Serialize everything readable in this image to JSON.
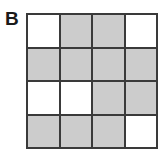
{
  "panel": {
    "label": "B"
  },
  "colors": {
    "filled": "#cccccc",
    "empty": "#ffffff",
    "grid_line": "#3a3a3a",
    "background": "#ffffff",
    "label_color": "#1a1a1a"
  },
  "grid": {
    "rows": 4,
    "columns": 4,
    "legend": {
      "filled": "shaded",
      "empty": "unshaded"
    },
    "cells": [
      [
        "empty",
        "filled",
        "filled",
        "empty"
      ],
      [
        "filled",
        "filled",
        "filled",
        "filled"
      ],
      [
        "empty",
        "empty",
        "filled",
        "filled"
      ],
      [
        "filled",
        "filled",
        "filled",
        "empty"
      ]
    ]
  }
}
